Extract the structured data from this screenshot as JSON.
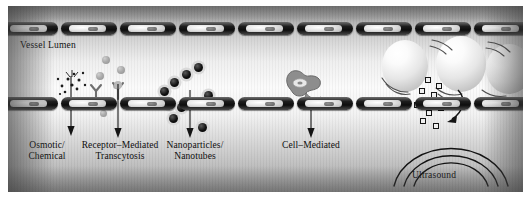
{
  "figure": {
    "type": "scientific-illustration",
    "palette": {
      "ink": "#0d0d0d",
      "cell": "#0d0d0d",
      "nucleus": "#e3e3e3",
      "background_light": "#fbfbfb",
      "background_dark": "#9b9b9b"
    }
  },
  "annotations": {
    "vessel_lumen": "Vessel Lumen",
    "ultrasound": "Ultrasound"
  },
  "mechanisms": [
    {
      "id": "osmotic",
      "line1": "Osmotic/",
      "line2": "Chemical"
    },
    {
      "id": "rmt",
      "line1": "Receptor–Mediated",
      "line2": "Transcytosis"
    },
    {
      "id": "nanoparticles",
      "line1": "Nanoparticles/",
      "line2": "Nanotubes"
    },
    {
      "id": "cell_mediated",
      "line1": "Cell–Mediated",
      "line2": ""
    }
  ],
  "elements": {
    "endothelial_cells_top": 9,
    "endothelial_cells_bottom": 9,
    "microbubbles": 3,
    "nanoparticles": 9,
    "receptors": 2,
    "ultrasound_arcs": 3
  }
}
